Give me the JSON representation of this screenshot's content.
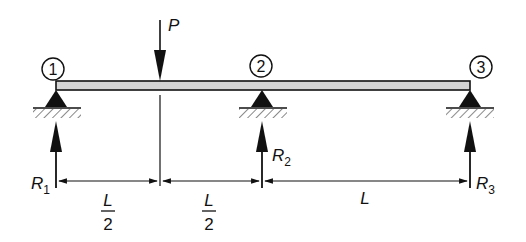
{
  "diagram": {
    "type": "continuous-beam-three-supports",
    "colors": {
      "ink": "#111111",
      "beam_fill": "#d4d4d4",
      "hatch": "#555555"
    },
    "nodes": [
      {
        "id": "1",
        "label": "1",
        "symbol": "①"
      },
      {
        "id": "2",
        "label": "2",
        "symbol": "②"
      },
      {
        "id": "3",
        "label": "3",
        "symbol": "③"
      }
    ],
    "load": {
      "label": "P",
      "direction": "down"
    },
    "reactions": [
      {
        "label": "R",
        "sub": "1"
      },
      {
        "label": "R",
        "sub": "2"
      },
      {
        "label": "R",
        "sub": "3"
      }
    ],
    "dimensions": [
      {
        "num": "L",
        "den": "2"
      },
      {
        "num": "L",
        "den": "2"
      },
      {
        "num": "L",
        "den": ""
      }
    ]
  }
}
